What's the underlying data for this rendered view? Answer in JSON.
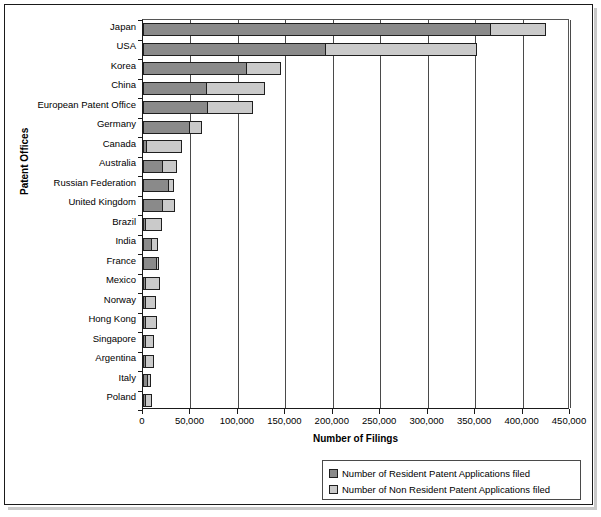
{
  "chart_data": {
    "type": "bar",
    "orientation": "horizontal",
    "stacked": true,
    "title": "",
    "xlabel": "Number of Filings",
    "ylabel": "Patent Offices",
    "xlim": [
      0,
      450000
    ],
    "xticks": [
      "0",
      "50,000",
      "100,000",
      "150,000",
      "200,000",
      "250,000",
      "300,000",
      "350,000",
      "400,000",
      "450,000"
    ],
    "xtick_values": [
      0,
      50000,
      100000,
      150000,
      200000,
      250000,
      300000,
      350000,
      400000,
      450000
    ],
    "grid": true,
    "legend_position": "bottom-right",
    "categories": [
      "Japan",
      "USA",
      "Korea",
      "China",
      "European Patent Office",
      "Germany",
      "Canada",
      "Australia",
      "Russian Federation",
      "United Kingdom",
      "Brazil",
      "India",
      "France",
      "Mexico",
      "Norway",
      "Hong Kong",
      "Singapore",
      "Argentina",
      "Italy",
      "Poland"
    ],
    "series": [
      {
        "name": "Number of Resident Patent Applications filed",
        "color": "#8a8a8a",
        "values": [
          367000,
          193000,
          110000,
          67000,
          69000,
          50000,
          4000,
          21000,
          27000,
          21000,
          2000,
          9000,
          15000,
          500,
          1000,
          500,
          500,
          1000,
          5000,
          3000
        ]
      },
      {
        "name": "Number of Non Resident Patent Applications filed",
        "color": "#cacaca",
        "values": [
          59000,
          160000,
          37000,
          63000,
          48000,
          13000,
          38000,
          16000,
          7000,
          14000,
          18000,
          8000,
          2000,
          16000,
          12000,
          13000,
          10000,
          10000,
          5000,
          7000
        ]
      }
    ],
    "totals": [
      426000,
      353000,
      147000,
      130000,
      117000,
      63000,
      42000,
      37000,
      34000,
      35000,
      20000,
      17000,
      17000,
      16500,
      13000,
      13500,
      10500,
      11000,
      10000,
      10000
    ]
  },
  "legend": {
    "items": [
      {
        "label": "Number of Resident Patent Applications filed",
        "color": "#8a8a8a"
      },
      {
        "label": "Number of Non Resident Patent Applications filed",
        "color": "#cacaca"
      }
    ]
  }
}
